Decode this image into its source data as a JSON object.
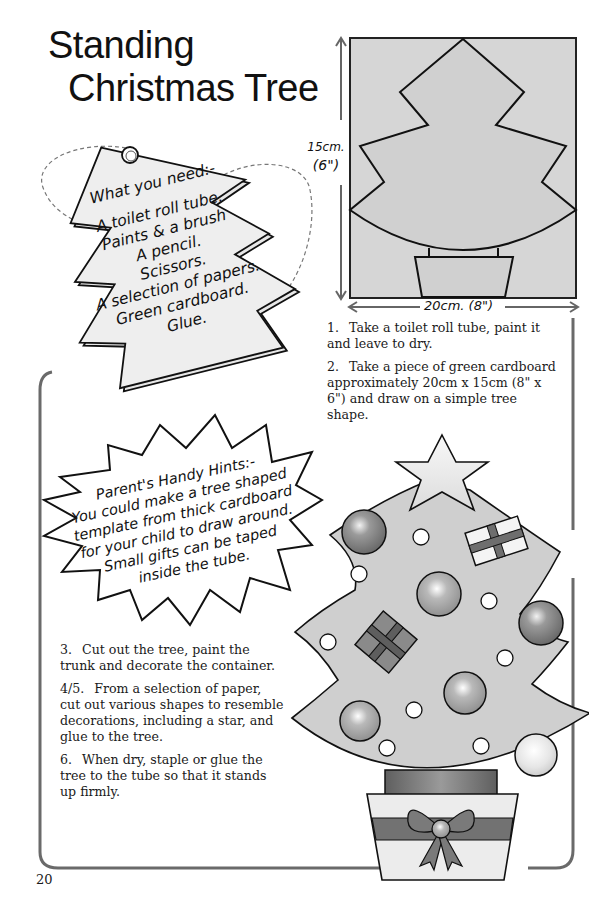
{
  "page": {
    "title_line1": "Standing",
    "title_line2": "Christmas Tree",
    "page_number": "20"
  },
  "requirements_tag": {
    "heading": "What you need:-",
    "items": [
      "A toilet roll tube.",
      "Paints & a brush",
      "A pencil.",
      "Scissors.",
      "A selection of papers.",
      "Green cardboard.",
      "Glue."
    ]
  },
  "template_diagram": {
    "height_label": "15cm.",
    "height_label_imperial": "(6\")",
    "width_label": "20cm. (8\")"
  },
  "hints": {
    "heading": "Parent's Handy Hints:-",
    "lines": [
      "You could make a tree shaped",
      "template from thick cardboard",
      "for your child to draw around.",
      "Small gifts can be taped",
      "inside the tube."
    ]
  },
  "steps": [
    {
      "num": "1.",
      "text": "Take a toilet roll tube, paint it and leave to dry."
    },
    {
      "num": "2.",
      "text": "Take a piece of green cardboard approximately 20cm x 15cm (8\" x 6\") and draw on a simple tree shape."
    },
    {
      "num": "3.",
      "text": "Cut out the tree, paint the trunk and decorate the container."
    },
    {
      "num": "4/5.",
      "text": "From a selection of paper, cut out various shapes to resemble decorations, including a star, and glue to the tree."
    },
    {
      "num": "6.",
      "text": "When dry, staple or glue the tree to the tube so that it stands up firmly."
    }
  ],
  "colors": {
    "ink": "#1a1a1a",
    "tree_fill": "#cfcfcf",
    "template_fill": "#d6d6d6",
    "bauble_dark": "#7d7d7d",
    "ribbon": "#6e6e6e",
    "frame": "#6a6a6a"
  }
}
